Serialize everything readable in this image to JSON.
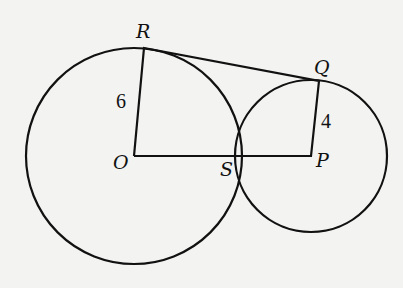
{
  "diagram": {
    "type": "geometry",
    "circles": [
      {
        "name": "circle-O",
        "center": "O",
        "cx": 134,
        "cy": 156,
        "r": 108
      },
      {
        "name": "circle-P",
        "center": "P",
        "cx": 311,
        "cy": 156,
        "r": 76
      }
    ],
    "points": {
      "R": {
        "label": "R",
        "x": 144,
        "y": 48
      },
      "Q": {
        "label": "Q",
        "x": 319,
        "y": 81
      },
      "O": {
        "label": "O",
        "x": 134,
        "y": 156
      },
      "S": {
        "label": "S",
        "x": 239,
        "y": 156
      },
      "P": {
        "label": "P",
        "x": 311,
        "y": 156
      }
    },
    "segments": [
      {
        "name": "segment-OR",
        "from": "O",
        "to": "R",
        "label": "6"
      },
      {
        "name": "segment-RQ",
        "from": "R",
        "to": "Q",
        "label": ""
      },
      {
        "name": "segment-QP",
        "from": "Q",
        "to": "P",
        "label": "4"
      },
      {
        "name": "segment-OP",
        "from": "O",
        "to": "P",
        "label": ""
      }
    ],
    "measure_labels": {
      "OR": "6",
      "PQ": "4"
    },
    "colors": {
      "background": "#f3f3f1",
      "stroke": "#111111"
    }
  }
}
